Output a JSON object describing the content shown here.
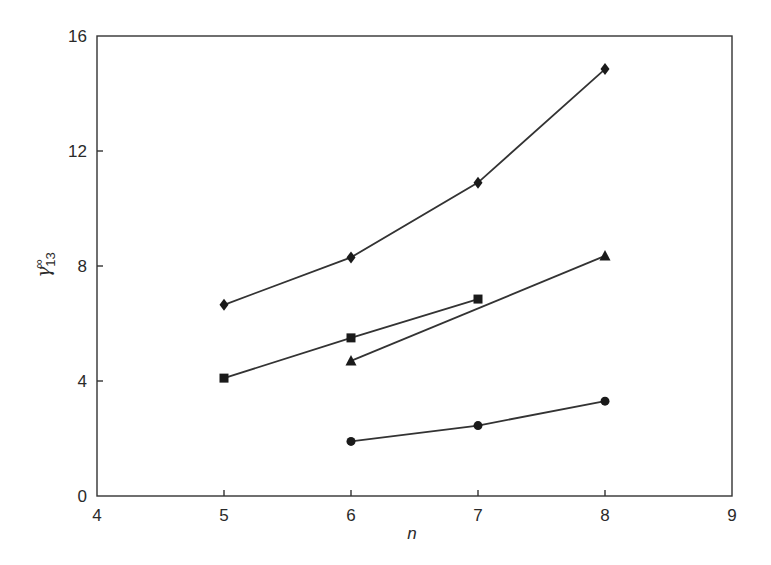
{
  "chart_data": {
    "type": "line",
    "title": "",
    "xlabel": "n",
    "ylabel": "γ13∞",
    "ylabel_parts": {
      "base": "γ",
      "subscript": "13",
      "superscript": "∞"
    },
    "xlim": [
      4,
      9
    ],
    "ylim": [
      0,
      16
    ],
    "xticks": [
      4,
      5,
      6,
      7,
      8,
      9
    ],
    "yticks": [
      0,
      4,
      8,
      12,
      16
    ],
    "grid": false,
    "legend": null,
    "series": [
      {
        "name": "diamond-series",
        "marker": "diamond",
        "x": [
          5,
          6,
          7,
          8
        ],
        "y": [
          6.65,
          8.3,
          10.9,
          14.85
        ]
      },
      {
        "name": "square-series",
        "marker": "square",
        "x": [
          5,
          6,
          7
        ],
        "y": [
          4.1,
          5.5,
          6.85
        ]
      },
      {
        "name": "triangle-series",
        "marker": "triangle",
        "x": [
          6,
          8
        ],
        "y": [
          4.7,
          8.35
        ]
      },
      {
        "name": "circle-series",
        "marker": "circle",
        "x": [
          6,
          7,
          8
        ],
        "y": [
          1.9,
          2.45,
          3.3
        ]
      }
    ],
    "colors": {
      "line": "#333333",
      "marker": "#1a1a1a",
      "axis": "#333333"
    }
  }
}
